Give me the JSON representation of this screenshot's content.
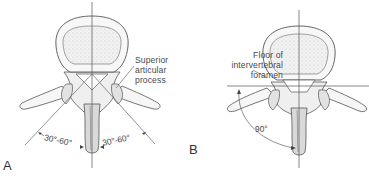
{
  "figure": {
    "panels": [
      {
        "id": "A",
        "letter": "A",
        "annotations": {
          "structure_label_line1": "Superior",
          "structure_label_line2": "articular",
          "structure_label_line3": "process",
          "angle_left": "30°-60°",
          "angle_right": "30°-60°"
        }
      },
      {
        "id": "B",
        "letter": "B",
        "annotations": {
          "structure_label_line1": "Floor of",
          "structure_label_line2": "intervertebral",
          "structure_label_line3": "foramen",
          "angle": "90°"
        }
      }
    ],
    "colors": {
      "line": "#555555",
      "bone_fill": "#f4f4f4",
      "body_stipple": "#e6e6e6",
      "shade": "#8a8a8a"
    }
  }
}
